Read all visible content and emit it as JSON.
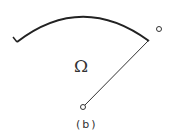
{
  "figure": {
    "region_label": "Ω",
    "caption": "(b)",
    "colors": {
      "stroke": "#222222",
      "background": "#ffffff"
    }
  }
}
